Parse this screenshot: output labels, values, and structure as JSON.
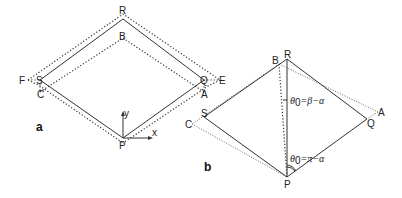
{
  "figure_a": {
    "panel_label": "a",
    "points": {
      "R": "R",
      "B": "B",
      "S": "S",
      "F": "F",
      "C": "C",
      "Q": "Q",
      "E": "E",
      "A": "A",
      "P": "P"
    },
    "axes": {
      "x": "x",
      "y": "y"
    }
  },
  "figure_b": {
    "panel_label": "b",
    "points": {
      "R": "R",
      "B": "B",
      "S": "S",
      "C": "C",
      "Q": "Q",
      "A": "A",
      "P": "P"
    },
    "angle_labels": {
      "top": {
        "theta": "θ",
        "sub": "0",
        "rest": "=β−α"
      },
      "bottom": {
        "theta": "θ",
        "sub": "0",
        "rest": "=π−α"
      }
    }
  }
}
